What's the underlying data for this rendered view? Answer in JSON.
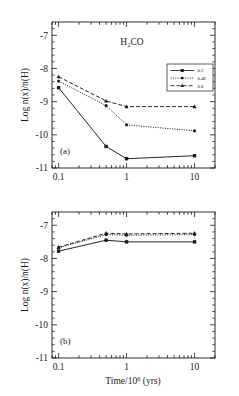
{
  "figure": {
    "species_title": "H₂CO",
    "xlabel": "Time/10⁶ (yrs)",
    "ylabel": "Log n(x)/n(H)",
    "panel_a_tag": "(a)",
    "panel_b_tag": "(b)",
    "xticks": [
      "0.1",
      "1",
      "10"
    ],
    "yticks": [
      "-7",
      "-8",
      "-9",
      "-10",
      "-11"
    ],
    "legend": {
      "entries": [
        {
          "label": "0.2",
          "style": "solid",
          "marker": "square"
        },
        {
          "label": "0.48",
          "style": "dotted",
          "marker": "circle"
        },
        {
          "label": "0.8",
          "style": "dashed",
          "marker": "triangle"
        }
      ]
    },
    "colors": {
      "ink": "#1a1a1a",
      "frame": "#1a1a1a",
      "background": "#ffffff"
    }
  },
  "chart_data": [
    {
      "type": "line",
      "panel": "(a)",
      "title": "H₂CO",
      "xlabel": "Time/10⁶ (yrs)",
      "ylabel": "Log n(x)/n(H)",
      "xscale": "log",
      "xlim": [
        0.08,
        20
      ],
      "ylim": [
        -11,
        -6.6
      ],
      "xticks": [
        0.1,
        1,
        10
      ],
      "yticks": [
        -7,
        -8,
        -9,
        -10,
        -11
      ],
      "grid": false,
      "legend_position": "upper-right",
      "x": [
        0.1,
        0.5,
        1,
        10
      ],
      "series": [
        {
          "name": "0.2",
          "style": "solid",
          "marker": "square",
          "values": [
            -8.58,
            -10.35,
            -10.72,
            -10.63
          ]
        },
        {
          "name": "0.48",
          "style": "dotted",
          "marker": "circle",
          "values": [
            -8.38,
            -9.12,
            -9.7,
            -9.88
          ]
        },
        {
          "name": "0.8",
          "style": "dashed",
          "marker": "triangle",
          "values": [
            -8.25,
            -8.98,
            -9.15,
            -9.15
          ]
        }
      ]
    },
    {
      "type": "line",
      "panel": "(b)",
      "xlabel": "Time/10⁶ (yrs)",
      "ylabel": "Log n(x)/n(H)",
      "xscale": "log",
      "xlim": [
        0.08,
        20
      ],
      "ylim": [
        -11,
        -6.6
      ],
      "xticks": [
        0.1,
        1,
        10
      ],
      "yticks": [
        -7,
        -8,
        -9,
        -10,
        -11
      ],
      "grid": false,
      "x": [
        0.1,
        0.5,
        1,
        10
      ],
      "series": [
        {
          "name": "0.2",
          "style": "solid",
          "marker": "square",
          "values": [
            -7.78,
            -7.45,
            -7.5,
            -7.5
          ]
        },
        {
          "name": "0.48",
          "style": "dotted",
          "marker": "circle",
          "values": [
            -7.68,
            -7.28,
            -7.3,
            -7.28
          ]
        },
        {
          "name": "0.8",
          "style": "dashed",
          "marker": "triangle",
          "values": [
            -7.66,
            -7.24,
            -7.26,
            -7.24
          ]
        }
      ]
    }
  ]
}
